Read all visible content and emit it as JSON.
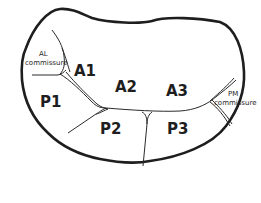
{
  "diagram": {
    "colors": {
      "outline": "#1e1e1e",
      "lines": "#2a2a2a",
      "background": "#ffffff"
    },
    "labels": {
      "a1": "A1",
      "a2": "A2",
      "a3": "A3",
      "p1": "P1",
      "p2": "P2",
      "p3": "P3",
      "al_line1": "AL",
      "al_line2": "commissure",
      "pm_line1": "PM",
      "pm_line2": "commissure"
    }
  }
}
